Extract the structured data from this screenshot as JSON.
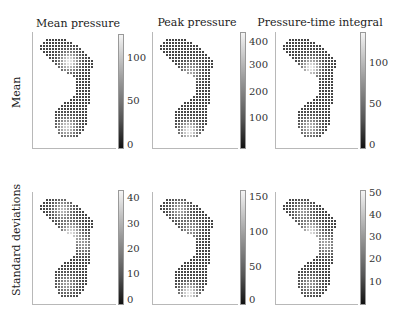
{
  "figure": {
    "row_labels": [
      "Mean",
      "Standard deviations"
    ],
    "column_titles": [
      "Mean pressure",
      "Peak pressure",
      "Pressure-time integral"
    ]
  },
  "chart_data": {
    "type": "heatmap",
    "panels": [
      {
        "row": "Mean",
        "column": "Mean pressure",
        "colorbar_ticks": [
          "0",
          "50",
          "100"
        ],
        "colorbar_range": [
          0,
          140
        ],
        "hotspots": [
          "forefoot",
          "heel"
        ]
      },
      {
        "row": "Mean",
        "column": "Peak pressure",
        "colorbar_ticks": [
          "100",
          "200",
          "300",
          "400"
        ],
        "colorbar_range": [
          0,
          440
        ],
        "hotspots": [
          "forefoot",
          "heel"
        ]
      },
      {
        "row": "Mean",
        "column": "Pressure-time integral",
        "colorbar_ticks": [
          "0",
          "50",
          "100"
        ],
        "colorbar_range": [
          0,
          140
        ],
        "hotspots": [
          "forefoot",
          "heel"
        ]
      },
      {
        "row": "Standard deviations",
        "column": "Mean pressure",
        "colorbar_ticks": [
          "0",
          "10",
          "20",
          "30",
          "40"
        ],
        "colorbar_range": [
          0,
          45
        ],
        "hotspots": [
          "toes",
          "forefoot",
          "heel"
        ]
      },
      {
        "row": "Standard deviations",
        "column": "Peak pressure",
        "colorbar_ticks": [
          "0",
          "50",
          "100",
          "150"
        ],
        "colorbar_range": [
          0,
          165
        ],
        "hotspots": [
          "toes",
          "heel"
        ]
      },
      {
        "row": "Standard deviations",
        "column": "Pressure-time integral",
        "colorbar_ticks": [
          "10",
          "20",
          "30",
          "40",
          "50"
        ],
        "colorbar_range": [
          0,
          53
        ],
        "hotspots": [
          "forefoot",
          "heel"
        ]
      }
    ]
  },
  "layout_panels": [
    {
      "ax": [
        32,
        32,
        92,
        117
      ],
      "cb": [
        118,
        34,
        115
      ],
      "title_x": 75,
      "title_y": 17,
      "ticks": [
        {
          "v": "0",
          "y": 145
        },
        {
          "v": "50",
          "y": 101
        },
        {
          "v": "100",
          "y": 58
        }
      ],
      "hot": [
        [
          0.52,
          0.22,
          1.0
        ],
        [
          0.48,
          0.88,
          0.85
        ]
      ]
    },
    {
      "ax": [
        152,
        32,
        94,
        117
      ],
      "cb": [
        240,
        32,
        117
      ],
      "title_x": 197,
      "title_y": 16,
      "ticks": [
        {
          "v": "100",
          "y": 118
        },
        {
          "v": "200",
          "y": 92
        },
        {
          "v": "300",
          "y": 65
        },
        {
          "v": "400",
          "y": 42
        }
      ],
      "hot": [
        [
          0.55,
          0.32,
          0.6
        ],
        [
          0.52,
          0.92,
          1.0
        ]
      ]
    },
    {
      "ax": [
        275,
        32,
        91,
        117
      ],
      "cb": [
        360,
        32,
        117
      ],
      "title_x": 318,
      "title_y": 16,
      "ticks": [
        {
          "v": "0",
          "y": 145
        },
        {
          "v": "50",
          "y": 104
        },
        {
          "v": "100",
          "y": 63
        }
      ],
      "hot": [
        [
          0.5,
          0.28,
          1.0
        ],
        [
          0.48,
          0.88,
          0.7
        ]
      ]
    },
    {
      "ax": [
        32,
        192,
        92,
        113
      ],
      "cb": [
        118,
        190,
        115
      ],
      "title_x": 0,
      "title_y": 0,
      "ticks": [
        {
          "v": "0",
          "y": 300
        },
        {
          "v": "10",
          "y": 274
        },
        {
          "v": "20",
          "y": 249
        },
        {
          "v": "30",
          "y": 224
        },
        {
          "v": "40",
          "y": 198
        }
      ],
      "hot": [
        [
          0.4,
          0.1,
          0.7
        ],
        [
          0.55,
          0.33,
          0.9
        ],
        [
          0.8,
          0.45,
          0.5
        ],
        [
          0.48,
          0.85,
          0.55
        ]
      ]
    },
    {
      "ax": [
        152,
        192,
        94,
        113
      ],
      "cb": [
        240,
        190,
        115
      ],
      "title_x": 0,
      "title_y": 0,
      "ticks": [
        {
          "v": "0",
          "y": 300
        },
        {
          "v": "50",
          "y": 267
        },
        {
          "v": "100",
          "y": 232
        },
        {
          "v": "150",
          "y": 197
        }
      ],
      "hot": [
        [
          0.35,
          0.1,
          0.6
        ],
        [
          0.55,
          0.3,
          0.5
        ],
        [
          0.52,
          0.94,
          1.0
        ]
      ]
    },
    {
      "ax": [
        275,
        192,
        91,
        113
      ],
      "cb": [
        360,
        190,
        115
      ],
      "title_x": 0,
      "title_y": 0,
      "ticks": [
        {
          "v": "10",
          "y": 282
        },
        {
          "v": "20",
          "y": 259
        },
        {
          "v": "30",
          "y": 237
        },
        {
          "v": "40",
          "y": 215
        },
        {
          "v": "50",
          "y": 193
        }
      ],
      "hot": [
        [
          0.35,
          0.12,
          0.5
        ],
        [
          0.5,
          0.32,
          0.9
        ],
        [
          0.78,
          0.45,
          0.6
        ],
        [
          0.48,
          0.85,
          0.5
        ]
      ]
    }
  ]
}
